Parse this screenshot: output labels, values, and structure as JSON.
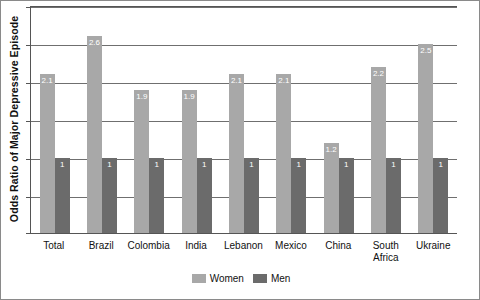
{
  "chart_data": {
    "type": "bar",
    "title": "",
    "xlabel": "",
    "ylabel": "Odds Ratio of Major Depressive Episode",
    "categories": [
      "Total",
      "Brazil",
      "Colombia",
      "India",
      "Lebanon",
      "Mexico",
      "China",
      "South Africa",
      "Ukraine"
    ],
    "series": [
      {
        "name": "Women",
        "color": "#a8a8a8",
        "values": [
          2.1,
          2.6,
          1.9,
          1.9,
          2.1,
          2.1,
          1.2,
          2.2,
          2.5
        ],
        "labels": [
          "2.1",
          "2.6",
          "1.9",
          "1.9",
          "2.1",
          "2.1",
          "1.2",
          "2.2",
          "2.5"
        ]
      },
      {
        "name": "Men",
        "color": "#6b6b6b",
        "values": [
          1,
          1,
          1,
          1,
          1,
          1,
          1,
          1,
          1
        ],
        "labels": [
          "1",
          "1",
          "1",
          "1",
          "1",
          "1",
          "1",
          "1",
          "1"
        ]
      }
    ],
    "ylim": [
      0,
      3.0
    ],
    "yticks": [
      0,
      0.5,
      1.0,
      1.5,
      2.0,
      2.5,
      3.0
    ],
    "ytick_labels": [
      "",
      "",
      "",
      "",
      "",
      "",
      ""
    ],
    "grid": true,
    "grid_axis": "y",
    "legend_position": "bottom-center"
  },
  "legend": {
    "items": [
      {
        "label": "Women",
        "color": "#a8a8a8"
      },
      {
        "label": "Men",
        "color": "#6b6b6b"
      }
    ]
  },
  "colors": {
    "women": "#a8a8a8",
    "men": "#6b6b6b",
    "gridline": "#6f6f6f",
    "axis": "#555555",
    "frame": "#8a8a8a",
    "value_label": "#ffffff",
    "background": "#ffffff"
  }
}
